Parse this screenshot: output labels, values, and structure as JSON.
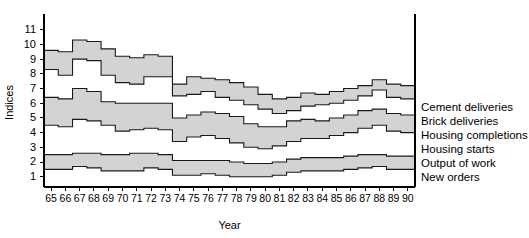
{
  "chart_data": {
    "type": "area",
    "title": "",
    "xlabel": "Year",
    "ylabel": "Indices",
    "grid": false,
    "legend_position": "right-inline",
    "xlim": [
      65,
      90
    ],
    "ylim": [
      0.3,
      11.8
    ],
    "yticks": [
      1,
      2,
      3,
      4,
      5,
      6,
      7,
      8,
      9,
      10,
      11
    ],
    "x": [
      65,
      66,
      67,
      68,
      69,
      70,
      71,
      72,
      73,
      74,
      75,
      76,
      77,
      78,
      79,
      80,
      81,
      82,
      83,
      84,
      85,
      86,
      87,
      88,
      89,
      90
    ],
    "xtick_labels": [
      "65",
      "66",
      "67",
      "68",
      "69",
      "70",
      "71",
      "72",
      "73",
      "74",
      "75",
      "76",
      "77",
      "78",
      "79",
      "80",
      "81",
      "82",
      "83",
      "84",
      "85",
      "86",
      "87",
      "88",
      "89",
      "90"
    ],
    "step_style": "post",
    "band_fill": "#d3d3d3",
    "band_stroke": "#1a1a1a",
    "series": [
      {
        "name": "Cement deliveries",
        "band": "top",
        "edge": "upper",
        "values": [
          9.6,
          9.5,
          10.3,
          10.2,
          9.7,
          9.2,
          9.1,
          9.3,
          9.2,
          7.3,
          7.8,
          7.7,
          7.6,
          7.4,
          7.1,
          6.6,
          6.3,
          6.4,
          6.7,
          6.6,
          6.8,
          7.0,
          7.2,
          7.6,
          7.3,
          7.2
        ]
      },
      {
        "name": "Brick deliveries",
        "band": "top",
        "edge": "lower",
        "values": [
          8.3,
          7.9,
          9.0,
          8.9,
          7.9,
          7.4,
          7.3,
          7.8,
          7.8,
          6.5,
          6.6,
          6.8,
          6.4,
          6.2,
          5.9,
          5.6,
          5.3,
          5.5,
          5.8,
          5.9,
          6.0,
          6.2,
          6.5,
          6.9,
          6.4,
          6.3
        ]
      },
      {
        "name": "Housing completions",
        "band": "middle",
        "edge": "upper",
        "values": [
          6.4,
          6.3,
          7.0,
          6.8,
          6.1,
          6.0,
          6.0,
          6.0,
          6.0,
          5.0,
          5.2,
          5.4,
          5.3,
          5.1,
          4.6,
          4.4,
          4.4,
          4.8,
          4.9,
          4.8,
          5.0,
          5.2,
          5.5,
          5.6,
          5.3,
          5.2
        ]
      },
      {
        "name": "Housing starts",
        "band": "middle",
        "edge": "lower",
        "values": [
          4.5,
          4.4,
          4.9,
          4.8,
          4.5,
          4.1,
          4.2,
          4.3,
          4.2,
          3.4,
          3.7,
          3.8,
          3.6,
          3.3,
          3.0,
          2.9,
          3.1,
          3.4,
          3.6,
          3.6,
          3.8,
          4.0,
          4.3,
          4.5,
          4.1,
          4.0
        ]
      },
      {
        "name": "Output of work",
        "band": "bottom",
        "edge": "upper",
        "values": [
          2.5,
          2.5,
          2.6,
          2.6,
          2.5,
          2.5,
          2.6,
          2.6,
          2.5,
          2.1,
          2.1,
          2.1,
          2.1,
          2.0,
          1.9,
          1.9,
          2.0,
          2.2,
          2.3,
          2.3,
          2.3,
          2.4,
          2.5,
          2.5,
          2.4,
          2.4
        ]
      },
      {
        "name": "New orders",
        "band": "bottom",
        "edge": "lower",
        "values": [
          1.5,
          1.5,
          1.7,
          1.6,
          1.4,
          1.4,
          1.4,
          1.6,
          1.5,
          1.1,
          1.1,
          1.2,
          1.1,
          1.0,
          1.0,
          1.0,
          1.1,
          1.3,
          1.4,
          1.4,
          1.4,
          1.5,
          1.6,
          1.7,
          1.5,
          1.5
        ]
      }
    ],
    "legend_entries": [
      {
        "label": "Cement deliveries",
        "y_value": 7.2
      },
      {
        "label": "Brick deliveries",
        "y_value": 6.3
      },
      {
        "label": "Housing completions",
        "y_value": 5.2
      },
      {
        "label": "Housing starts",
        "y_value": 4.0
      },
      {
        "label": "Output of work",
        "y_value": 2.4
      },
      {
        "label": "New orders",
        "y_value": 1.5
      }
    ]
  }
}
